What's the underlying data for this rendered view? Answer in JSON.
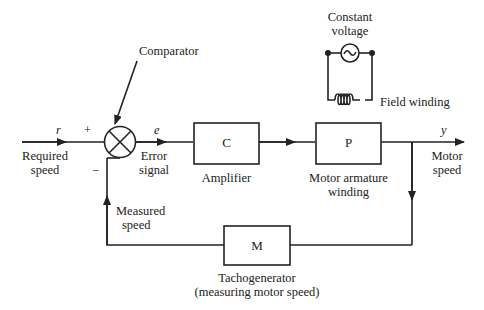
{
  "diagram": {
    "type": "feedback control block diagram",
    "signals": {
      "input_symbol": "r",
      "input_label": [
        "Required",
        "speed"
      ],
      "error_symbol": "e",
      "error_label": [
        "Error",
        "signal"
      ],
      "output_symbol": "y",
      "output_label": [
        "Motor",
        "speed"
      ],
      "feedback_label": [
        "Measured",
        "speed"
      ],
      "plus_sign": "+",
      "minus_sign": "−"
    },
    "comparator": {
      "label": "Comparator"
    },
    "blocks": {
      "controller": {
        "symbol": "C",
        "label": "Amplifier"
      },
      "plant": {
        "symbol": "P",
        "label": [
          "Motor armature",
          "winding"
        ]
      },
      "sensor": {
        "symbol": "M",
        "label": [
          "Tachogenerator",
          "(measuring motor speed)"
        ]
      }
    },
    "field_circuit": {
      "source_label": [
        "Constant",
        "voltage"
      ],
      "winding_label": "Field winding"
    }
  }
}
